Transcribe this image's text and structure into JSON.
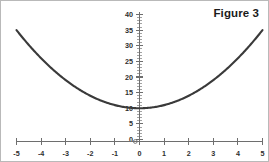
{
  "figure": {
    "title": "Figure 3",
    "border_color": "#b9b9b9",
    "background": "#ffffff"
  },
  "chart_data": {
    "type": "line",
    "title": "Figure 3",
    "xlabel": "",
    "ylabel": "",
    "curve_label": "y = x^2 + 10",
    "xlim": [
      -5,
      5
    ],
    "ylim": [
      0,
      40
    ],
    "grid": false,
    "legend": "none",
    "curve_color": "#3a3a3a",
    "axis_color": "#6e6e6e",
    "x_ticks": [
      -5,
      -4,
      -3,
      -2,
      -1,
      0,
      1,
      2,
      3,
      4,
      5
    ],
    "x_tick_labels": [
      "-5",
      "-4",
      "-3",
      "-2",
      "-1",
      "0",
      "1",
      "2",
      "3",
      "4",
      "5"
    ],
    "y_ticks": [
      0,
      5,
      10,
      15,
      20,
      25,
      30,
      35,
      40
    ],
    "y_tick_labels": [
      "0",
      "5",
      "10",
      "15",
      "20",
      "25",
      "30",
      "35",
      "40"
    ],
    "y_minor_tick_step": 1,
    "vertex": [
      0,
      10
    ],
    "x": [
      -5,
      -4.5,
      -4,
      -3.5,
      -3,
      -2.5,
      -2,
      -1.5,
      -1,
      -0.5,
      0,
      0.5,
      1,
      1.5,
      2,
      2.5,
      3,
      3.5,
      4,
      4.5,
      5
    ],
    "y": [
      35,
      30.25,
      26,
      22.25,
      19,
      16.25,
      14,
      12.25,
      11,
      10.25,
      10,
      10.25,
      11,
      12.25,
      14,
      16.25,
      19,
      22.25,
      26,
      30.25,
      35
    ]
  }
}
